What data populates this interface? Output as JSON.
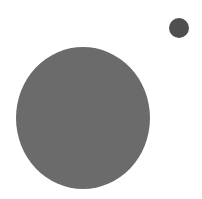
{
  "canvas": {
    "width": 202,
    "height": 199,
    "background": "#ffffff"
  },
  "shapes": [
    {
      "name": "large-circle",
      "cx": 83,
      "cy": 118,
      "rx": 67,
      "ry": 71,
      "color": "#6b6b6b"
    },
    {
      "name": "small-circle",
      "cx": 179,
      "cy": 28,
      "rx": 10,
      "ry": 10,
      "color": "#4f4f4f"
    }
  ]
}
